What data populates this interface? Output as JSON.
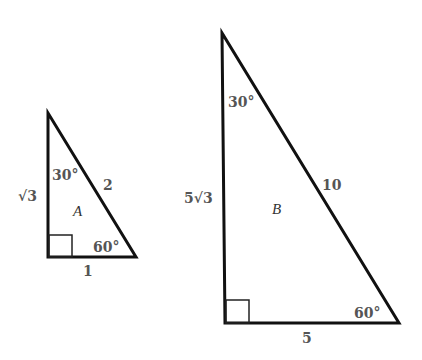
{
  "triangles": [
    {
      "name": "A",
      "label": "A",
      "angle_top": "30°",
      "angle_bottom": "60°",
      "side_vertical": "√3",
      "side_hypotenuse": "2",
      "side_base": "1"
    },
    {
      "name": "B",
      "label": "B",
      "angle_top": "30°",
      "angle_bottom": "60°",
      "side_vertical": "5√3",
      "side_hypotenuse": "10",
      "side_base": "5"
    }
  ]
}
